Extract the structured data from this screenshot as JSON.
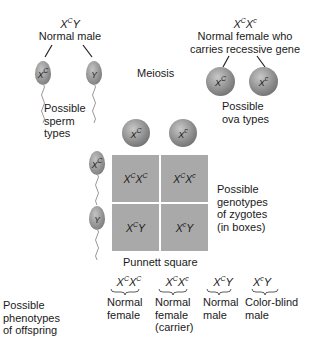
{
  "father": {
    "genotype": {
      "base": "X",
      "sup": "C",
      "rest": "Y"
    },
    "label": "Normal male",
    "sperm": [
      {
        "base": "X",
        "sup": "C"
      },
      {
        "base": "Y",
        "sup": ""
      }
    ],
    "caption_lines": [
      "Possible",
      "sperm",
      "types"
    ]
  },
  "mother": {
    "genotype": {
      "a_base": "X",
      "a_sup": "C",
      "b_base": "X",
      "b_sup": "c"
    },
    "label_lines": [
      "Normal female who",
      "carries recessive gene"
    ],
    "ova": [
      {
        "base": "X",
        "sup": "C"
      },
      {
        "base": "X",
        "sup": "c"
      }
    ],
    "caption_lines": [
      "Possible",
      "ova types"
    ]
  },
  "meiosis_label": "Meiosis",
  "punnett": {
    "top_ova": [
      {
        "base": "X",
        "sup": "C"
      },
      {
        "base": "X",
        "sup": "c"
      }
    ],
    "side_sperm": [
      {
        "base": "X",
        "sup": "C"
      },
      {
        "base": "Y",
        "sup": ""
      }
    ],
    "cells": [
      {
        "a": "X",
        "a_sup": "C",
        "b": "X",
        "b_sup": "C"
      },
      {
        "a": "X",
        "a_sup": "C",
        "b": "X",
        "b_sup": "c"
      },
      {
        "a": "X",
        "a_sup": "C",
        "b": "Y",
        "b_sup": ""
      },
      {
        "a": "X",
        "a_sup": "c",
        "b": "Y",
        "b_sup": ""
      }
    ],
    "caption": "Punnett square",
    "zygote_caption_lines": [
      "Possible",
      "genotypes",
      "of zygotes",
      "(in boxes)"
    ],
    "cell_color": "#a9a9a9"
  },
  "phenotypes": {
    "caption_lines": [
      "Possible",
      "phenotypes",
      "of offspring"
    ],
    "items": [
      {
        "a": "X",
        "a_sup": "C",
        "b": "X",
        "b_sup": "C",
        "lines": [
          "Normal",
          "female"
        ]
      },
      {
        "a": "X",
        "a_sup": "C",
        "b": "X",
        "b_sup": "c",
        "lines": [
          "Normal",
          "female",
          "(carrier)"
        ]
      },
      {
        "a": "X",
        "a_sup": "C",
        "b": "Y",
        "b_sup": "",
        "lines": [
          "Normal",
          "male"
        ]
      },
      {
        "a": "X",
        "a_sup": "c",
        "b": "Y",
        "b_sup": "",
        "lines": [
          "Color-blind",
          "male"
        ]
      }
    ]
  }
}
